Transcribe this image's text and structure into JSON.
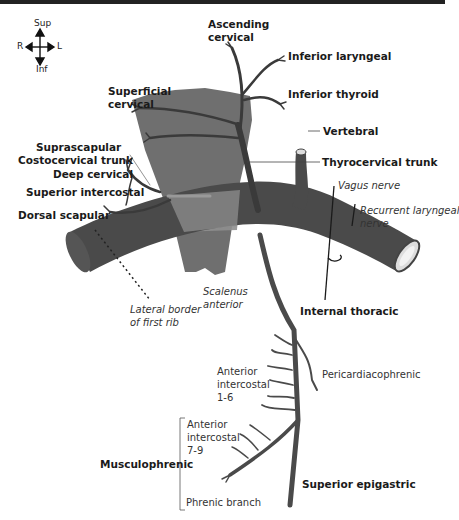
{
  "compass": {
    "sup": "Sup",
    "inf": "Inf",
    "right": "R",
    "left": "L"
  },
  "labels": {
    "ascending_cervical": [
      "Ascending",
      "cervical"
    ],
    "inferior_laryngeal": "Inferior laryngeal",
    "inferior_thyroid": "Inferior thyroid",
    "superficial_cervical": [
      "Superficial",
      "cervical"
    ],
    "vertebral": "Vertebral",
    "suprascapular": "Suprascapular",
    "costocervical_trunk": "Costocervical trunk",
    "thyrocervical_trunk": "Thyrocervical trunk",
    "deep_cervical": "Deep cervical",
    "superior_intercostal": "Superior intercostal",
    "vagus_nerve": "Vagus nerve",
    "recurrent_laryngeal_nerve": [
      "Recurrent laryngeal",
      "nerve"
    ],
    "dorsal_scapular": "Dorsal scapular",
    "scalenus_anterior": [
      "Scalenus",
      "anterior"
    ],
    "lateral_border": [
      "Lateral border",
      "of first rib"
    ],
    "internal_thoracic": "Internal thoracic",
    "anterior_intercostal_1_6": [
      "Anterior",
      "intercostal",
      "1-6"
    ],
    "pericardiacophrenic": "Pericardiacophrenic",
    "anterior_intercostal_7_9": [
      "Anterior",
      "intercostal",
      "7-9"
    ],
    "musculophrenic": "Musculophrenic",
    "superior_epigastric": "Superior epigastric",
    "phrenic_branch": "Phrenic branch"
  },
  "colors": {
    "artery": "#4a4a4a",
    "muscle": "#6f6f6f",
    "muscle_overlap": "#8f8f8f",
    "lumen": "#e6e6e6",
    "text": "#1a1a1a"
  }
}
